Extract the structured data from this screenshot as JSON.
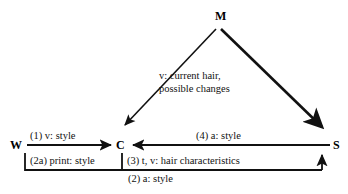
{
  "diagram": {
    "type": "collaboration-diagram",
    "nodes": [
      {
        "id": "M",
        "label": "M",
        "x": 218,
        "y": 16
      },
      {
        "id": "W",
        "label": "W",
        "x": 16,
        "y": 145
      },
      {
        "id": "C",
        "label": "C",
        "x": 122,
        "y": 145
      },
      {
        "id": "S",
        "label": "S",
        "x": 338,
        "y": 145
      }
    ],
    "edges": [
      {
        "id": "w-to-c",
        "from": "W",
        "to": "C",
        "label": "(1) v: style",
        "direction": "right",
        "style": "solid"
      },
      {
        "id": "s-to-c",
        "from": "S",
        "to": "C",
        "label": "(4) a: style",
        "direction": "left",
        "style": "solid"
      },
      {
        "id": "c-to-w",
        "from": "C",
        "to": "W",
        "label": "(2a) print: style",
        "direction": "left",
        "style": "bracket"
      },
      {
        "id": "c-to-s",
        "from": "C",
        "to": "S",
        "label": "(3) t, v: hair characteristics",
        "direction": "right",
        "style": "bracket"
      },
      {
        "id": "w-to-s",
        "from": "W",
        "to": "S",
        "label": "(2) a: style",
        "direction": "up",
        "style": "bracket"
      },
      {
        "id": "m-to-c",
        "from": "M",
        "to": "C",
        "label": "",
        "direction": "down-left",
        "style": "solid"
      },
      {
        "id": "m-to-s",
        "from": "M",
        "to": "S",
        "label": "",
        "direction": "down-right",
        "style": "solid-thick"
      }
    ],
    "annotations": [
      {
        "id": "m-messages",
        "line1": "v: current hair,",
        "line2": "possible changes"
      }
    ],
    "colors": {
      "stroke": "#111111",
      "text": "#111111",
      "background": "#ffffff"
    }
  }
}
